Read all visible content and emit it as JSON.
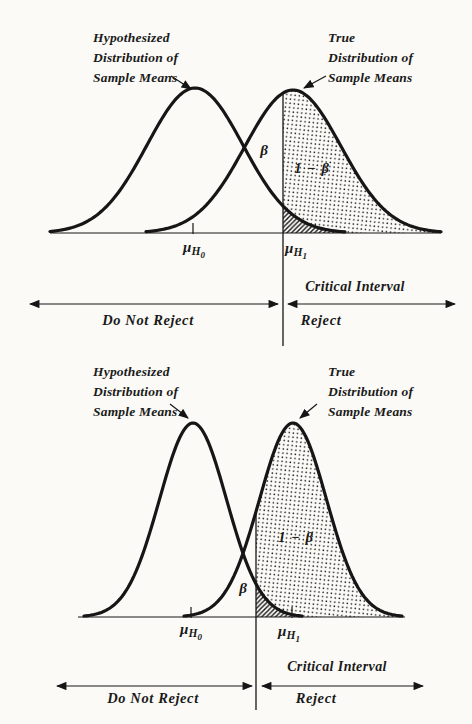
{
  "colors": {
    "ink": "#161616",
    "paper": "#fbfaf7"
  },
  "panels": [
    {
      "role": "wide-dispersion-panel",
      "labels": {
        "hyp_lines": [
          "Hypothesized",
          "Distribution of",
          "Sample Means"
        ],
        "true_lines": [
          "True",
          "Distribution of",
          "Sample Means"
        ],
        "beta": "β",
        "power": "1 − β",
        "mu_h0": {
          "base": "μ",
          "sub": "H",
          "subsub": "0"
        },
        "mu_h1": {
          "base": "μ",
          "sub": "H",
          "subsub": "1"
        },
        "critical_interval": "Critical Interval",
        "do_not_reject": "Do Not Reject",
        "reject": "Reject"
      },
      "geometry": {
        "axis": {
          "y": 233,
          "x1": 50,
          "x2": 441
        },
        "hyp_curve": {
          "mean": 195,
          "sigma": 48,
          "height": 145,
          "x_start": 50,
          "x_end": 345
        },
        "true_curve": {
          "mean": 293,
          "sigma": 48,
          "height": 143,
          "x_start": 146,
          "x_end": 441
        },
        "critical_x": 283,
        "critical_line_bottom": 346,
        "mean_ticks": [
          193
        ],
        "decision_arrows": {
          "y": 304,
          "left": [
            30,
            278
          ],
          "right": [
            288,
            455
          ]
        },
        "annotation_arrows": [
          [
            171,
            76,
            191,
            89
          ],
          [
            326,
            76,
            304,
            88
          ]
        ]
      }
    },
    {
      "role": "narrow-dispersion-panel",
      "labels": {
        "hyp_lines": [
          "Hypothesized",
          "Distribution of",
          "Sample Means"
        ],
        "true_lines": [
          "True",
          "Distribution of",
          "Sample Means"
        ],
        "beta": "β",
        "power": "1 − β",
        "mu_h0": {
          "base": "μ",
          "sub": "H",
          "subsub": "0"
        },
        "mu_h1": {
          "base": "μ",
          "sub": "H",
          "subsub": "1"
        },
        "critical_interval": "Critical Interval",
        "do_not_reject": "Do Not Reject",
        "reject": "Reject"
      },
      "geometry": {
        "axis": {
          "y": 617,
          "x1": 78,
          "x2": 405
        },
        "hyp_curve": {
          "mean": 193,
          "sigma": 33.5,
          "height": 194,
          "x_start": 84,
          "x_end": 302
        },
        "true_curve": {
          "mean": 293,
          "sigma": 33.5,
          "height": 194,
          "x_start": 184,
          "x_end": 402
        },
        "critical_x": 256,
        "critical_line_bottom": 710,
        "mean_ticks": [
          191,
          292
        ],
        "decision_arrows": {
          "y": 686,
          "left": [
            57,
            252
          ],
          "right": [
            262,
            423
          ]
        },
        "annotation_arrows": [
          [
            170,
            404,
            188,
            418
          ],
          [
            317,
            404,
            300,
            418
          ]
        ]
      }
    }
  ]
}
